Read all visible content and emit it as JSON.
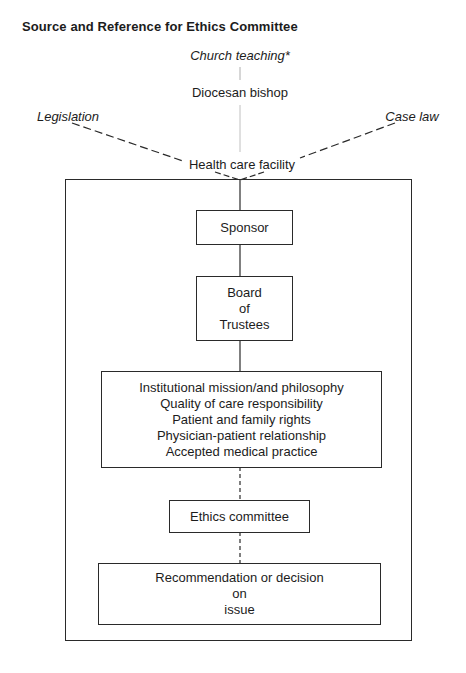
{
  "title": "Source and Reference for Ethics Committee",
  "top_sources": {
    "church_teaching": "Church teaching*",
    "diocesan_bishop": "Diocesan bishop",
    "legislation": "Legislation",
    "case_law": "Case law",
    "health_care_facility": "Health care facility"
  },
  "boxes": {
    "sponsor": [
      "Sponsor"
    ],
    "board": [
      "Board",
      "of",
      "Trustees"
    ],
    "institutional": [
      "Institutional mission/and philosophy",
      "Quality of care responsibility",
      "Patient and family rights",
      "Physician-patient relationship",
      "Accepted medical practice"
    ],
    "ethics": [
      "Ethics committee"
    ],
    "recommendation": [
      "Recommendation or decision",
      "on",
      "issue"
    ]
  },
  "connectors": {
    "church_to_bishop": "solid-light",
    "bishop_to_facility": "solid-light",
    "legislation_to_facility": "dashed",
    "case_law_to_facility": "dashed",
    "facility_to_sponsor": "solid",
    "sponsor_to_board": "solid",
    "board_to_institutional": "solid",
    "institutional_to_ethics": "dashed",
    "ethics_to_recommendation": "dashed"
  }
}
